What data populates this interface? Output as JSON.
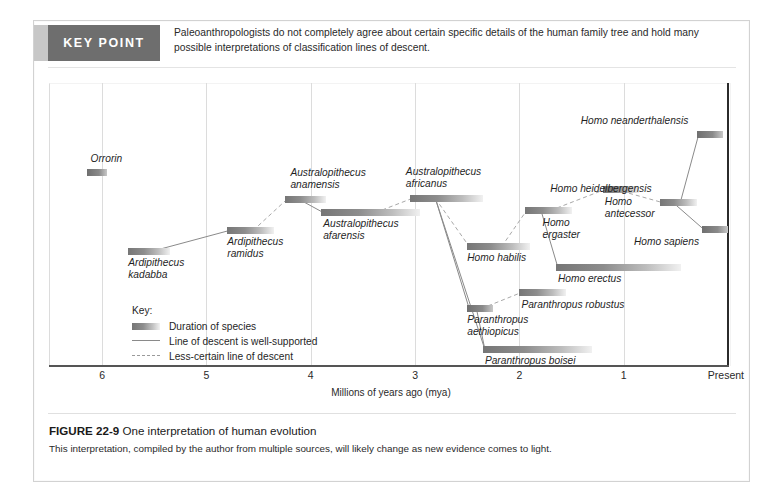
{
  "keypoint": {
    "badge": "KEY POINT",
    "text": "Paleoanthropologists do not completely agree about certain specific details of the human family tree and hold many possible interpretations of classification lines of descent."
  },
  "caption": {
    "figure_number": "FIGURE 22-9",
    "title": "One interpretation of human evolution",
    "body": "This interpretation, compiled by the author from multiple sources, will likely change as new evidence comes to light."
  },
  "key": {
    "title": "Key:",
    "items": [
      "Duration of species",
      "Line of descent is well-supported",
      "Less-certain line of descent"
    ]
  },
  "chart_data": {
    "type": "bar",
    "title": "One interpretation of human evolution",
    "xlabel": "Millions of years ago (mya)",
    "ylabel": "",
    "xlim": [
      6.5,
      0
    ],
    "grid": true,
    "legend": "inside-left",
    "tick_labels": [
      "6",
      "5",
      "4",
      "3",
      "2",
      "1",
      "Present"
    ],
    "tick_values": [
      6,
      5,
      4,
      3,
      2,
      1,
      0
    ],
    "categories": [
      "Orrorin",
      "Ardipithecus kadabba",
      "Ardipithecus ramidus",
      "Australopithecus anamensis",
      "Australopithecus afarensis",
      "Australopithecus africanus",
      "Homo habilis",
      "Homo ergaster",
      "Homo erectus",
      "Homo antecessor",
      "Homo heidelbergensis",
      "Homo neanderthalensis",
      "Homo sapiens",
      "Paranthropus aethiopicus",
      "Paranthropus robustus",
      "Paranthropus boisei"
    ],
    "bars": [
      {
        "name": "Orrorin",
        "start_mya": 6.15,
        "end_mya": 5.95,
        "label": "Orrorin",
        "label_lines": [
          "Orrorin"
        ]
      },
      {
        "name": "Ardipithecus kadabba",
        "start_mya": 5.75,
        "end_mya": 5.35,
        "label": "Ardipithecus kadabba",
        "label_lines": [
          "Ardipithecus",
          "kadabba"
        ]
      },
      {
        "name": "Ardipithecus ramidus",
        "start_mya": 4.8,
        "end_mya": 4.35,
        "label": "Ardipithecus ramidus",
        "label_lines": [
          "Ardipithecus",
          "ramidus"
        ]
      },
      {
        "name": "Australopithecus anamensis",
        "start_mya": 4.25,
        "end_mya": 3.85,
        "label": "Australopithecus anamensis",
        "label_lines": [
          "Australopithecus",
          "anamensis"
        ]
      },
      {
        "name": "Australopithecus afarensis",
        "start_mya": 3.9,
        "end_mya": 2.95,
        "label": "Australopithecus afarensis",
        "label_lines": [
          "Australopithecus",
          "afarensis"
        ]
      },
      {
        "name": "Australopithecus africanus",
        "start_mya": 3.05,
        "end_mya": 2.35,
        "label": "Australopithecus africanus",
        "label_lines": [
          "Australopithecus",
          "africanus"
        ]
      },
      {
        "name": "Homo habilis",
        "start_mya": 2.5,
        "end_mya": 1.9,
        "label": "Homo habilis",
        "label_lines": [
          "Homo habilis"
        ]
      },
      {
        "name": "Homo ergaster",
        "start_mya": 1.95,
        "end_mya": 1.5,
        "label": "Homo ergaster",
        "label_lines": [
          "Homo",
          "ergaster"
        ]
      },
      {
        "name": "Homo erectus",
        "start_mya": 1.65,
        "end_mya": 0.45,
        "label": "Homo erectus",
        "label_lines": [
          "Homo erectus"
        ]
      },
      {
        "name": "Homo antecessor",
        "start_mya": 1.2,
        "end_mya": 0.85,
        "label": "Homo antecessor",
        "label_lines": [
          "Homo",
          "antecessor"
        ]
      },
      {
        "name": "Homo heidelbergensis",
        "start_mya": 0.65,
        "end_mya": 0.3,
        "label": "Homo heidelbergensis",
        "label_lines": [
          "Homo heidelbergensis"
        ]
      },
      {
        "name": "Homo neanderthalensis",
        "start_mya": 0.3,
        "end_mya": 0.05,
        "label": "Homo neanderthalensis",
        "label_lines": [
          "Homo neanderthalensis"
        ]
      },
      {
        "name": "Homo sapiens",
        "start_mya": 0.25,
        "end_mya": 0.0,
        "label": "Homo sapiens",
        "label_lines": [
          "Homo sapiens"
        ]
      },
      {
        "name": "Paranthropus aethiopicus",
        "start_mya": 2.5,
        "end_mya": 2.25,
        "label": "Paranthropus aethiopicus",
        "label_lines": [
          "Paranthropus",
          "aethiopicus"
        ]
      },
      {
        "name": "Paranthropus robustus",
        "start_mya": 2.0,
        "end_mya": 1.55,
        "label": "Paranthropus robustus",
        "label_lines": [
          "Paranthropus robustus"
        ]
      },
      {
        "name": "Paranthropus boisei",
        "start_mya": 2.35,
        "end_mya": 1.3,
        "label": "Paranthropus boisei",
        "label_lines": [
          "Paranthropus boisei"
        ]
      }
    ],
    "descent_lines": [
      {
        "from": "Ardipithecus kadabba",
        "to": "Ardipithecus ramidus",
        "certain": true
      },
      {
        "from": "Ardipithecus ramidus",
        "to": "Australopithecus anamensis",
        "certain": false
      },
      {
        "from": "Australopithecus anamensis",
        "to": "Australopithecus afarensis",
        "certain": true
      },
      {
        "from": "Australopithecus afarensis",
        "to": "Australopithecus africanus",
        "certain": false
      },
      {
        "from": "Australopithecus africanus",
        "to": "Homo habilis",
        "certain": false
      },
      {
        "from": "Australopithecus africanus",
        "to": "Paranthropus aethiopicus",
        "certain": true
      },
      {
        "from": "Australopithecus africanus",
        "to": "Paranthropus boisei",
        "certain": true
      },
      {
        "from": "Homo habilis",
        "to": "Homo ergaster",
        "certain": false
      },
      {
        "from": "Homo ergaster",
        "to": "Homo erectus",
        "certain": true
      },
      {
        "from": "Homo ergaster",
        "to": "Homo antecessor",
        "certain": false
      },
      {
        "from": "Homo antecessor",
        "to": "Homo heidelbergensis",
        "certain": false
      },
      {
        "from": "Homo heidelbergensis",
        "to": "Homo neanderthalensis",
        "certain": true
      },
      {
        "from": "Homo heidelbergensis",
        "to": "Homo sapiens",
        "certain": true
      },
      {
        "from": "Paranthropus aethiopicus",
        "to": "Paranthropus robustus",
        "certain": false
      },
      {
        "from": "Paranthropus aethiopicus",
        "to": "Paranthropus boisei",
        "certain": true
      }
    ]
  },
  "colors": {
    "banner": "#6e6e6e",
    "banner_tab": "#c7c7c7",
    "bar_dark": "#767676",
    "grid": "#dcdcdc",
    "axis": "#555555",
    "present_line": "#2b2b2b",
    "text": "#1f1f1f"
  }
}
